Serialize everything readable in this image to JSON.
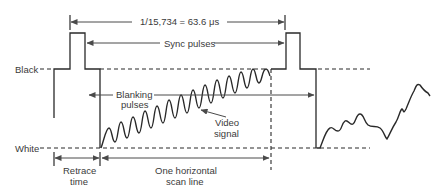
{
  "figure": {
    "type": "Composite video signal - one horizontal scan line",
    "levels": {
      "black_label": "Black",
      "white_label": "White"
    },
    "annotations": {
      "period": "1/15,734 = 63.6 μs",
      "sync_pulses": "Sync pulses",
      "blanking_line1": "Blanking",
      "blanking_line2": "pulses",
      "video_line1": "Video",
      "video_line2": "signal",
      "retrace_line1": "Retrace",
      "retrace_line2": "time",
      "scan_line1": "One horizontal",
      "scan_line2": "scan line"
    },
    "colors": {
      "line": "#2a2a2a",
      "text": "#3a3a3a",
      "background": "#ffffff"
    }
  }
}
